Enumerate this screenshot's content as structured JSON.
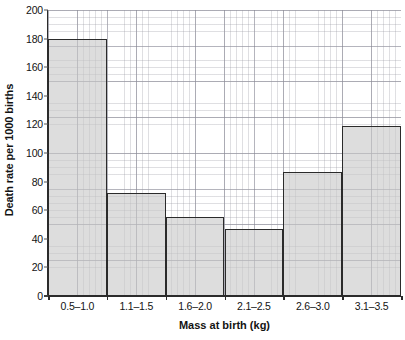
{
  "chart_data": {
    "type": "bar",
    "title": "",
    "xlabel": "Mass at birth (kg)",
    "ylabel": "Death rate per 1000 births",
    "categories": [
      "0.5–1.0",
      "1.1–1.5",
      "1.6–2.0",
      "2.1–2.5",
      "2.6–3.0",
      "3.1–3.5"
    ],
    "values": [
      180,
      72,
      55,
      47,
      87,
      119
    ],
    "ylim": [
      0,
      200
    ],
    "ytick_step": 20,
    "yticks": [
      0,
      20,
      40,
      60,
      80,
      100,
      120,
      140,
      160,
      180,
      200
    ],
    "ytick_labels": [
      "0",
      "20",
      "40",
      "60",
      "80",
      "100",
      "120",
      "140",
      "160",
      "180",
      "200"
    ],
    "grid": true,
    "grid_style": "graph-paper minor and major gridlines",
    "legend": false,
    "legend_position": "none",
    "bar_fill_color": "#c8c8c8",
    "bar_edge_color": "#2b2b2b",
    "axis_color": "#2b2b2b",
    "text_color": "#131313"
  }
}
